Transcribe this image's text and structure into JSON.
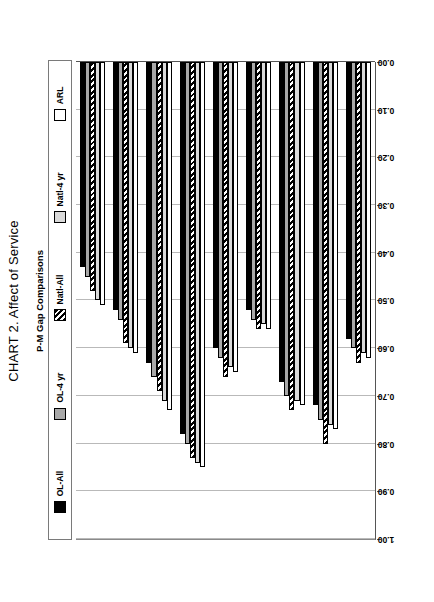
{
  "chart": {
    "title": "CHART 2. Affect of Service",
    "subtitle": "P-M Gap Comparisons",
    "category_axis_title": "Questions"
  },
  "legend": {
    "items": [
      {
        "label": "OL-All",
        "style": "s-black",
        "icon": "legend-swatch-black"
      },
      {
        "label": "OL-4 yr",
        "style": "s-gray",
        "icon": "legend-swatch-gray"
      },
      {
        "label": "Natl-All",
        "style": "s-hatch",
        "icon": "legend-swatch-hatched"
      },
      {
        "label": "Natl-4 yr",
        "style": "s-light",
        "icon": "legend-swatch-light-gray"
      },
      {
        "label": "ARL",
        "style": "s-white",
        "icon": "legend-swatch-white"
      }
    ]
  },
  "chart_data": {
    "type": "bar",
    "orientation": "horizontal",
    "title": "CHART 2. Affect of Service",
    "subtitle": "P-M Gap Comparisons",
    "xlabel": "Questions",
    "ylabel": "",
    "ylim": [
      0.0,
      1.0
    ],
    "ytick_step": 0.1,
    "ytick_labels": [
      "1.00",
      "0.90",
      "0.80",
      "0.70",
      "0.60",
      "0.50",
      "0.40",
      "0.30",
      "0.20",
      "0.10",
      "0.00"
    ],
    "grid": true,
    "legend_position": "top",
    "categories": [
      {
        "number": "1",
        "label": "Willingness to help users"
      },
      {
        "number": "4",
        "label": "Employees who are consistently courteous"
      },
      {
        "number": "11",
        "label": "Dependability in handling users' service problems"
      },
      {
        "number": "14",
        "label": "Giving users individual attention"
      },
      {
        "number": "15",
        "label": "Employees who deal with users in a caring fashion"
      },
      {
        "number": "17",
        "label": "Employees who have the knowledge to answer user questions"
      },
      {
        "number": "18",
        "label": "Readiness to respond to user's questions"
      },
      {
        "number": "20",
        "label": "Employees who instill confidence in users"
      },
      {
        "number": "24",
        "label": "Employees who understand the needs of their users"
      }
    ],
    "series": [
      {
        "name": "OL-All",
        "style": "s-black",
        "values": [
          0.43,
          0.52,
          0.63,
          0.78,
          0.6,
          0.52,
          0.67,
          0.72,
          0.58
        ]
      },
      {
        "name": "OL-4 yr",
        "style": "s-gray",
        "values": [
          0.45,
          0.54,
          0.66,
          0.8,
          0.62,
          0.54,
          0.7,
          0.75,
          0.6
        ]
      },
      {
        "name": "Natl-All",
        "style": "s-hatch",
        "values": [
          0.48,
          0.59,
          0.69,
          0.83,
          0.66,
          0.56,
          0.73,
          0.8,
          0.63
        ]
      },
      {
        "name": "Natl-4 yr",
        "style": "s-light",
        "values": [
          0.5,
          0.6,
          0.71,
          0.84,
          0.64,
          0.55,
          0.71,
          0.76,
          0.61
        ]
      },
      {
        "name": "ARL",
        "style": "s-white",
        "values": [
          0.51,
          0.61,
          0.73,
          0.85,
          0.65,
          0.56,
          0.72,
          0.77,
          0.62
        ]
      }
    ]
  }
}
